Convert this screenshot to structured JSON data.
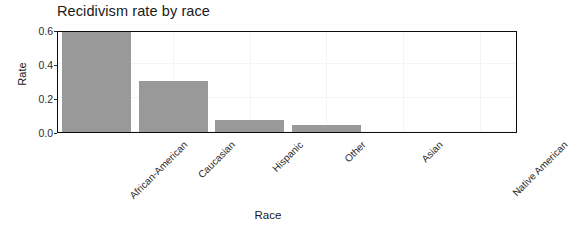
{
  "chart_data": {
    "type": "bar",
    "title": "Recidivism rate by race",
    "xlabel": "Race",
    "ylabel": "Rate",
    "categories": [
      "African-American",
      "Caucasian",
      "Hispanic",
      "Other",
      "Asian",
      "Native American"
    ],
    "values": [
      0.59,
      0.3,
      0.07,
      0.04,
      0.0,
      0.0
    ],
    "ylim": [
      0.0,
      0.6
    ],
    "yticks": [
      0.0,
      0.2,
      0.4,
      0.6
    ],
    "ytick_labels": [
      "0.0",
      "0.2",
      "0.4",
      "0.6"
    ],
    "grid": true,
    "legend": null,
    "bar_color": "#999999",
    "panel_border_color": "#0d0d0d",
    "background_color": "#ffffff",
    "xtick_label_rotation": 45
  }
}
